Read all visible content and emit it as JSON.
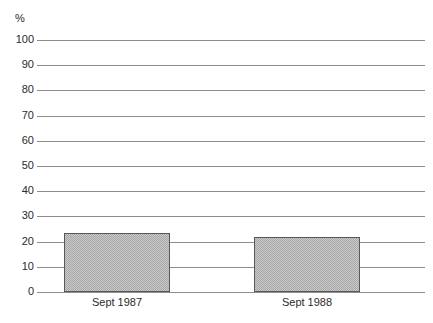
{
  "axis": {
    "unit_label": "%",
    "tick_labels": [
      "100",
      "90",
      "80",
      "70",
      "60",
      "50",
      "40",
      "30",
      "20",
      "10",
      "0"
    ]
  },
  "categories": [
    "Sept 1987",
    "Sept 1988"
  ],
  "colors": {
    "gridline": "#8d8d8d",
    "bar_border": "#585858",
    "bar_fill": "#c9c9c9",
    "text": "#2b2b2b",
    "background": "#ffffff"
  },
  "chart_data": {
    "type": "bar",
    "title": "",
    "subtitle": "",
    "xlabel": "",
    "ylabel": "%",
    "categories": [
      "Sept 1987",
      "Sept 1988"
    ],
    "values": [
      23.5,
      21.8
    ],
    "ylim": [
      0,
      100
    ],
    "ytick_step": 10,
    "yticks": [
      0,
      10,
      20,
      30,
      40,
      50,
      60,
      70,
      80,
      90,
      100
    ],
    "ytick_labels": [
      "0",
      "10",
      "20",
      "30",
      "40",
      "50",
      "60",
      "70",
      "80",
      "90",
      "100"
    ],
    "grid": true,
    "grid_axis": "y",
    "legend": false,
    "legend_position": "none",
    "annotations": [],
    "series": [
      {
        "name": "",
        "values": [
          23.5,
          21.8
        ]
      }
    ]
  }
}
